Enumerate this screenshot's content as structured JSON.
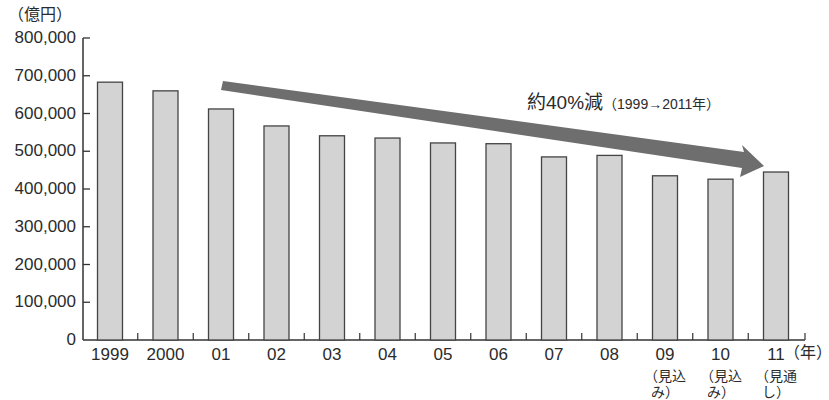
{
  "chart_data": {
    "type": "bar",
    "title": "",
    "ylabel": "（億円）",
    "xlabel": "（年）",
    "ylim": [
      0,
      800000
    ],
    "yticks": [
      "0",
      "100,000",
      "200,000",
      "300,000",
      "400,000",
      "500,000",
      "600,000",
      "700,000",
      "800,000"
    ],
    "grid": false,
    "categories": [
      "1999",
      "2000",
      "01",
      "02",
      "03",
      "04",
      "05",
      "06",
      "07",
      "08",
      "09",
      "10",
      "11"
    ],
    "category_notes": [
      "",
      "",
      "",
      "",
      "",
      "",
      "",
      "",
      "",
      "",
      "（見込み）",
      "（見込み）",
      "（見通し）"
    ],
    "values": [
      683000,
      660000,
      612000,
      567000,
      541000,
      535000,
      522000,
      520000,
      485000,
      489000,
      435000,
      426000,
      445000
    ],
    "bar_color": "#d3d3d3",
    "bar_edge_color": "#444444",
    "annotation": {
      "main": "約40%減",
      "detail": "（1999→2011年）",
      "arrow_color": "#6e6e6e"
    },
    "legend": null
  }
}
